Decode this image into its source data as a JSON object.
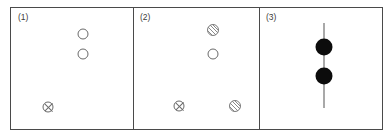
{
  "figure": {
    "name": "three-panel-marker-diagram",
    "width": 392,
    "height": 139,
    "background_color": "#ffffff",
    "frame_color": "#4a4a4a"
  },
  "legend_symbols": {
    "open_circle": "open-circle",
    "crossed_circle": "crossed-circle",
    "hatched_circle": "hatched-circle",
    "filled_circle": "filled-circle",
    "vertical_line": "vertical-line"
  },
  "panels": [
    {
      "label": "(1)",
      "name": "panel-1",
      "markers": [
        {
          "type": "open-circle",
          "x": 72,
          "y": 26,
          "name": "open-circle-upper"
        },
        {
          "type": "open-circle",
          "x": 72,
          "y": 46,
          "name": "open-circle-lower"
        },
        {
          "type": "crossed-circle",
          "x": 37,
          "y": 99,
          "name": "crossed-circle"
        }
      ],
      "lines": []
    },
    {
      "label": "(2)",
      "name": "panel-2",
      "markers": [
        {
          "type": "hatched-circle",
          "x": 80,
          "y": 22,
          "name": "hatched-circle-top"
        },
        {
          "type": "open-circle",
          "x": 80,
          "y": 46,
          "name": "open-circle-middle"
        },
        {
          "type": "crossed-circle",
          "x": 46,
          "y": 98,
          "name": "crossed-circle-bottom-left"
        },
        {
          "type": "hatched-circle",
          "x": 102,
          "y": 98,
          "name": "hatched-circle-bottom-right"
        }
      ],
      "lines": []
    },
    {
      "label": "(3)",
      "name": "panel-3",
      "markers": [
        {
          "type": "filled-circle",
          "x": 65,
          "y": 39,
          "name": "filled-circle-upper"
        },
        {
          "type": "filled-circle",
          "x": 65,
          "y": 68,
          "name": "filled-circle-lower"
        }
      ],
      "lines": [
        {
          "type": "vertical-line",
          "x": 65,
          "y1": 15,
          "y2": 100,
          "name": "vertical-line"
        }
      ]
    }
  ]
}
